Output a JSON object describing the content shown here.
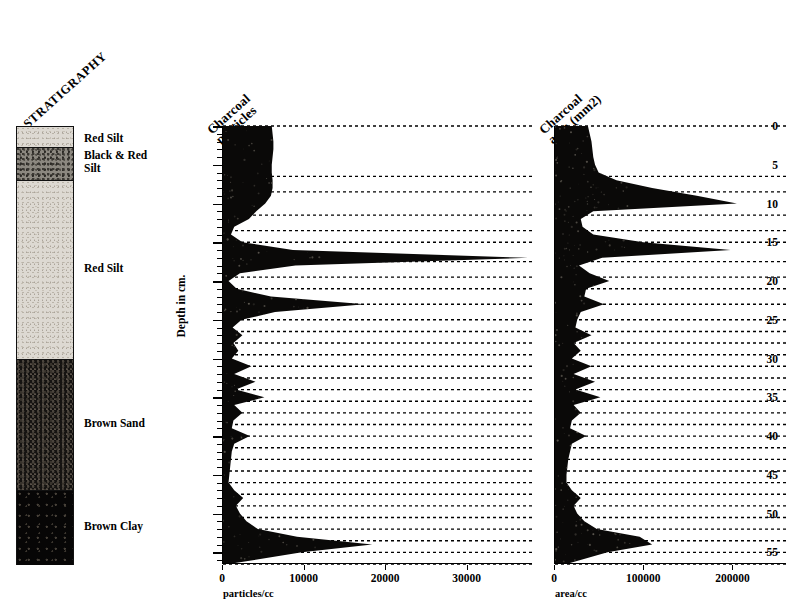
{
  "figure": {
    "stratigraphy_title": "STRATIGRAPHY",
    "depth_axis_title": "Depth in cm.",
    "depth_ticks": [
      0,
      5,
      10,
      15,
      20,
      25,
      30,
      35,
      40,
      45,
      50,
      55
    ],
    "depth_range": [
      0,
      56.5
    ]
  },
  "stratigraphy": {
    "layers": [
      {
        "name": "Red Silt",
        "label": "Red Silt",
        "top_cm": 0.0,
        "bottom_cm": 2.7,
        "fill": "f-redsilt",
        "color": "#ddd9d2"
      },
      {
        "name": "Black & Red Silt",
        "label": "Black & Red\nSilt",
        "top_cm": 2.7,
        "bottom_cm": 7.0,
        "fill": "f-blackred",
        "color": "#8c8880"
      },
      {
        "name": "Red Silt 2",
        "label": "Red Silt",
        "top_cm": 7.0,
        "bottom_cm": 30.0,
        "fill": "f-redsilt",
        "color": "#ddd9d2"
      },
      {
        "name": "Brown Sand",
        "label": "Brown Sand",
        "top_cm": 30.0,
        "bottom_cm": 47.0,
        "fill": "f-brownsand",
        "color": "#151311"
      },
      {
        "name": "Brown Clay",
        "label": "Brown Clay",
        "top_cm": 47.0,
        "bottom_cm": 56.5,
        "fill": "f-brownclay",
        "color": "#070606"
      }
    ]
  },
  "chart_data": [
    {
      "type": "area",
      "name": "charcoal-particles",
      "title": "Charcoal\nparticles",
      "xlabel": "particles/cc",
      "ylabel": "Depth in cm.",
      "orientation": "horizontal-depth",
      "xlim": [
        0,
        38000
      ],
      "ylim": [
        0,
        56.5
      ],
      "xticks": [
        0,
        10000,
        20000,
        30000
      ],
      "xticklabels": [
        "0",
        "10000",
        "20000",
        "30000"
      ],
      "grid": "dotted-sample-lines",
      "depth_cm": [
        0,
        1,
        2,
        3,
        4,
        5,
        6,
        7,
        8,
        9,
        10,
        11,
        12,
        13,
        14,
        15,
        16,
        17,
        18,
        19,
        20,
        21,
        22,
        23,
        24,
        25,
        26,
        27,
        28,
        29,
        30,
        31,
        32,
        33,
        34,
        35,
        36,
        37,
        38,
        39,
        40,
        41,
        42,
        43,
        44,
        45,
        46,
        47,
        48,
        49,
        50,
        51,
        52,
        53,
        54,
        55,
        56.5
      ],
      "values": [
        6100,
        6200,
        6300,
        6300,
        6200,
        6100,
        6100,
        6200,
        6200,
        6000,
        5300,
        4200,
        3300,
        1500,
        1100,
        2500,
        8700,
        37500,
        9000,
        2200,
        800,
        1800,
        6000,
        17500,
        6500,
        2400,
        1300,
        2500,
        1400,
        2000,
        1200,
        3600,
        1500,
        4100,
        1700,
        5200,
        1500,
        2500,
        1400,
        1200,
        3400,
        1500,
        1200,
        1100,
        1000,
        900,
        800,
        1500,
        2600,
        1700,
        2200,
        3000,
        4400,
        9200,
        18400,
        9800,
        800
      ]
    },
    {
      "type": "area",
      "name": "charcoal-area",
      "title": "Charcoal\narea (mm2)",
      "xlabel": "area/cc",
      "ylabel": "Depth in cm.",
      "orientation": "horizontal-depth",
      "xlim": [
        0,
        260000
      ],
      "ylim": [
        0,
        56.5
      ],
      "xticks": [
        0,
        100000,
        200000
      ],
      "xticklabels": [
        "0",
        "100000",
        "200000"
      ],
      "grid": "dotted-sample-lines",
      "depth_cm": [
        0,
        1,
        2,
        3,
        4,
        5,
        6,
        7,
        8,
        9,
        10,
        11,
        12,
        13,
        14,
        15,
        16,
        17,
        18,
        19,
        20,
        21,
        22,
        23,
        24,
        25,
        26,
        27,
        28,
        29,
        30,
        31,
        32,
        33,
        34,
        35,
        36,
        37,
        38,
        39,
        40,
        41,
        42,
        43,
        44,
        45,
        46,
        47,
        48,
        49,
        50,
        51,
        52,
        53,
        54,
        55,
        56.5
      ],
      "values": [
        38000,
        40000,
        42000,
        43000,
        44000,
        46000,
        50000,
        70000,
        110000,
        160000,
        205000,
        44000,
        30000,
        32000,
        44000,
        100000,
        198000,
        54000,
        28000,
        40000,
        62000,
        36000,
        34000,
        56000,
        30000,
        26000,
        24000,
        42000,
        22000,
        30000,
        20000,
        42000,
        22000,
        46000,
        24000,
        52000,
        22000,
        30000,
        20000,
        18000,
        36000,
        20000,
        18000,
        16000,
        15000,
        14000,
        14000,
        20000,
        30000,
        22000,
        26000,
        34000,
        48000,
        96000,
        110000,
        60000,
        14000
      ]
    }
  ],
  "sample_lines": {
    "description": "dotted horizontal lines at each sampled depth extending to right edge of each panel",
    "depths_cm": [
      0,
      6.5,
      8.5,
      11.5,
      13.5,
      15,
      17.5,
      19.5,
      21,
      23,
      25,
      26.5,
      28,
      29.5,
      31,
      32.5,
      34,
      35.5,
      37,
      38.5,
      40,
      41.5,
      43,
      44.5,
      46,
      47.5,
      49,
      50.5,
      52,
      53.5,
      55,
      56.5
    ]
  }
}
